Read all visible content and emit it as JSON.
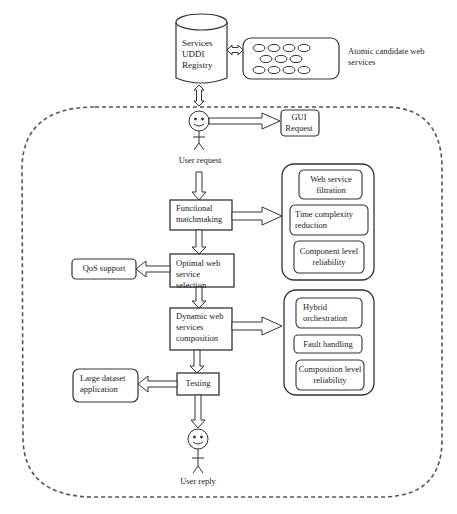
{
  "diagram": {
    "registry": {
      "label": "Services UDDI Registry"
    },
    "atomic_services": {
      "label": "Atomic candidate web services",
      "oval_count": 11
    },
    "actors": {
      "user_request": {
        "label": "User request"
      },
      "user_reply": {
        "label": "User reply"
      }
    },
    "gui_request": {
      "label": "GUI Request"
    },
    "flow_steps": [
      {
        "id": "functional",
        "label": "Functional matchmaking"
      },
      {
        "id": "optimal",
        "label": "Optimal web service selection"
      },
      {
        "id": "dynamic",
        "label": "Dynamic web services composition"
      },
      {
        "id": "testing",
        "label": "Testing"
      }
    ],
    "side_outputs": {
      "qos": {
        "label": "QoS support"
      },
      "large_dataset": {
        "label": "Large dataset application"
      }
    },
    "group_top": {
      "items": [
        {
          "label": "Web service filtration"
        },
        {
          "label": "Time complexity reduction"
        },
        {
          "label": "Component level reliability"
        }
      ]
    },
    "group_bottom": {
      "items": [
        {
          "label": "Hybrid orchestration"
        },
        {
          "label": "Fault handling"
        },
        {
          "label": "Composition level reliability"
        }
      ]
    },
    "colors": {
      "stroke": "#333333",
      "dash": "#555555",
      "background": "#ffffff"
    }
  }
}
